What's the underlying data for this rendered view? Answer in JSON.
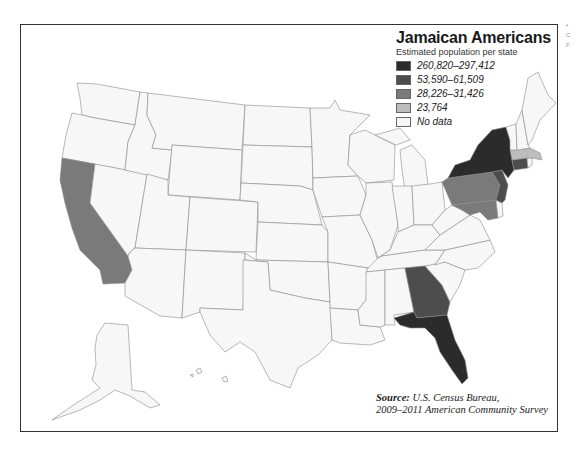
{
  "legend": {
    "title": "Jamaican Americans",
    "subtitle": "Estimated population per state",
    "items": [
      {
        "label": "260,820–297,412",
        "color": "#2b2b2b"
      },
      {
        "label": "53,590–61,509",
        "color": "#4d4d4d"
      },
      {
        "label": "28,226–31,426",
        "color": "#7a7a7a"
      },
      {
        "label": "23,764",
        "color": "#bdbdbd"
      },
      {
        "label": "No data",
        "color": "#f7f7f7"
      }
    ]
  },
  "source": {
    "prefix": "Source:",
    "line1": "U.S. Census Bureau,",
    "line2": "2009–2011 American Community Survey"
  },
  "map_data": {
    "states_by_class": {
      "260,820–297,412": [
        "New York",
        "Florida"
      ],
      "53,590–61,509": [
        "New Jersey",
        "Georgia",
        "Connecticut"
      ],
      "28,226–31,426": [
        "California",
        "Pennsylvania",
        "Maryland"
      ],
      "23,764": [
        "Massachusetts"
      ],
      "No data": [
        "All other states"
      ]
    }
  },
  "edge_artifacts": [
    "▪",
    "C",
    "F"
  ]
}
